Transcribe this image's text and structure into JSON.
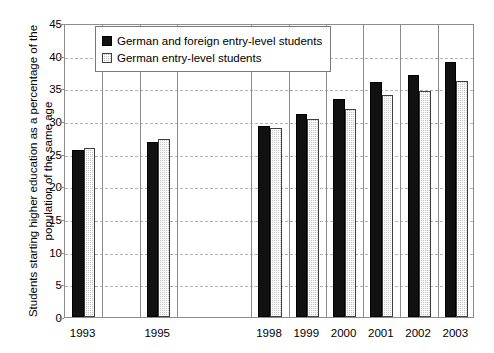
{
  "chart_data": {
    "type": "bar",
    "title": "",
    "subtitle": "",
    "xlabel": "",
    "ylabel_lines": [
      "Students starting higher education as a percentage of the",
      "population of the same age"
    ],
    "ylabel": "Students starting higher education as a percentage of the population of the same age",
    "categories": [
      "1993",
      "1995",
      "1998",
      "1999",
      "2000",
      "2001",
      "2002",
      "2003"
    ],
    "category_slots": [
      0,
      2,
      5,
      6,
      7,
      8,
      9,
      10
    ],
    "total_slots": 11,
    "series": [
      {
        "name": "German and foreign entry-level students",
        "color": "#111111",
        "values": [
          25.5,
          26.8,
          29.2,
          31.0,
          33.4,
          36.0,
          37.0,
          39.0
        ]
      },
      {
        "name": "German entry-level students",
        "color": "#c8c8c8",
        "values": [
          25.9,
          27.2,
          28.9,
          30.3,
          31.9,
          34.0,
          34.6,
          36.2
        ]
      }
    ],
    "ylim": [
      0,
      45
    ],
    "yticks": [
      0,
      5,
      10,
      15,
      20,
      25,
      30,
      35,
      40,
      45
    ],
    "ytick_labels": [
      "0",
      "5",
      "10",
      "15",
      "20",
      "25",
      "30",
      "35",
      "40",
      "45"
    ],
    "grid": true,
    "grid_axis": "y",
    "grid_style": "dashed",
    "legend_position": "top-left-inside",
    "legend_entries": [
      "German and foreign entry-level students",
      "German entry-level students"
    ],
    "background_color": "#ffffff",
    "axis_color": "#8c8c8c",
    "gridline_color": "#b4b4b4"
  }
}
